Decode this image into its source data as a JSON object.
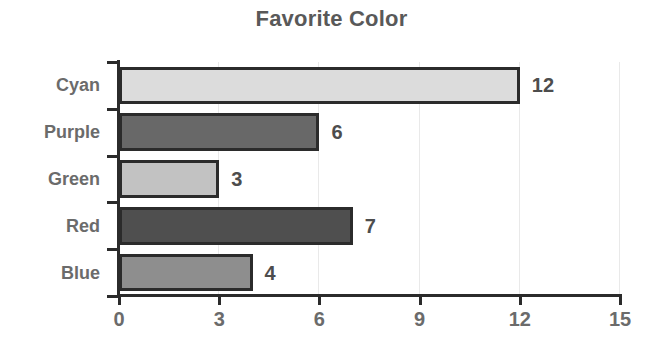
{
  "chart_data": {
    "type": "bar",
    "orientation": "horizontal",
    "title": "Favorite Color",
    "xlabel": "",
    "ylabel": "",
    "categories": [
      "Cyan",
      "Purple",
      "Green",
      "Red",
      "Blue"
    ],
    "values": [
      12,
      6,
      3,
      7,
      4
    ],
    "value_labels": [
      "12",
      "6",
      "3",
      "7",
      "4"
    ],
    "bar_colors": [
      "#dcdcdc",
      "#686868",
      "#c2c2c2",
      "#4f4f4f",
      "#8e8e8e"
    ],
    "bar_edge_color": "#2b2b2b",
    "xlim": [
      0,
      15
    ],
    "xticks": [
      0,
      3,
      6,
      9,
      12,
      15
    ],
    "xtick_labels": [
      "0",
      "3",
      "6",
      "9",
      "12",
      "15"
    ],
    "grid": "vertical-faint",
    "legend": "none",
    "title_color": "#595959",
    "label_color": "#6b6b6b",
    "value_color": "#4d4d4d",
    "background": "#ffffff"
  }
}
